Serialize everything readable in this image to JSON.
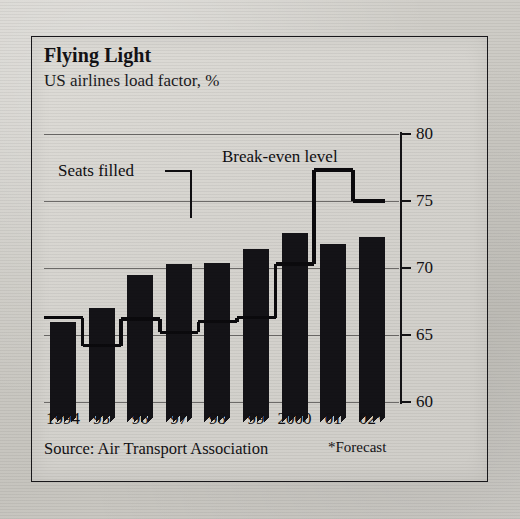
{
  "figure": {
    "title": "Flying Light",
    "subtitle": "US airlines load factor, %",
    "source": "Source: Air Transport Association",
    "forecast_note": "*Forecast",
    "annotations": {
      "series_label": "Seats filled",
      "line_label": "Break-even level"
    }
  },
  "chart_data": {
    "type": "bar",
    "title": "Flying Light",
    "subtitle": "US airlines load factor, %",
    "xlabel": "",
    "ylabel": "US airlines load factor, %",
    "ylim": [
      58.5,
      80.5
    ],
    "yticks": [
      60,
      65,
      70,
      75,
      80
    ],
    "ytick_labels": [
      "60",
      "65",
      "70",
      "75",
      "80"
    ],
    "grid": true,
    "grid_axis": "y",
    "axis_position": "right",
    "broken_axis": true,
    "categories": [
      "1994",
      "95",
      "96",
      "97",
      "98",
      "99",
      "2000",
      "01",
      "02*"
    ],
    "series": [
      {
        "name": "Seats filled",
        "type": "bar",
        "color": "#141317",
        "values": [
          66.0,
          67.0,
          69.5,
          70.3,
          70.4,
          71.4,
          72.6,
          71.8,
          72.3
        ]
      },
      {
        "name": "Break-even level",
        "type": "step",
        "color": "#0b0a0d",
        "values": [
          66.3,
          64.2,
          66.2,
          65.2,
          66.0,
          66.3,
          70.3,
          77.3,
          75.0
        ]
      }
    ],
    "notes": [
      "*Forecast"
    ],
    "source": "Air Transport Association",
    "legend": "inline-annotations"
  }
}
